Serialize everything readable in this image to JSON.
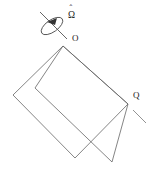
{
  "figure": {
    "background_color": "#ffffff",
    "stroke_color": "#666666",
    "label_color": "#1a1a1a",
    "width": 152,
    "height": 180
  },
  "labels": {
    "origin": "O",
    "point_q": "Q",
    "angular_velocity": "Ω",
    "angular_velocity_hat": "ˆ"
  },
  "annotations": {
    "spin_indicator": "rotation-arrow",
    "axis_indicator": "rotation-axis",
    "tangent_indicator": "velocity-direction-dash"
  },
  "geometry": {
    "shape_a_vertices": "63,46 13,95 75,158 128,104",
    "shape_b_vertices": "63,46 35,88 112,162 128,104",
    "axis_line": {
      "x1": 40,
      "y1": 12,
      "x2": 67,
      "y2": 39
    },
    "spin_ellipse": {
      "cx": 52,
      "cy": 26,
      "rx": 12,
      "ry": 6,
      "rotation": -35
    },
    "arrow_tip": {
      "x": 48,
      "y": 21
    },
    "tangent_dash": {
      "x1": 133,
      "y1": 110,
      "x2": 146,
      "y2": 123
    },
    "label_o": {
      "x": 72,
      "y": 41
    },
    "label_q": {
      "x": 133,
      "y": 98
    },
    "label_omega": {
      "x": 68,
      "y": 17
    },
    "label_omega_hat": {
      "x": 70,
      "y": 9
    }
  }
}
